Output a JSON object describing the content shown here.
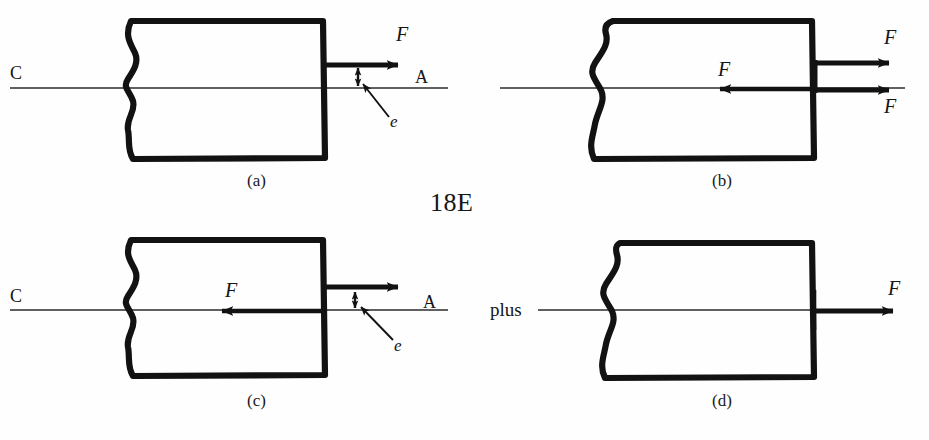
{
  "figure": {
    "center_label": "18E",
    "background_color": "#fefefe",
    "ink_color": "#111111",
    "panel_count": 4
  },
  "panels": [
    {
      "id": "a",
      "caption": "(a)",
      "left_axis_label": "C",
      "right_axis_label": "A",
      "eccentricity_label": "e",
      "forces": [
        {
          "label": "F",
          "direction": "right",
          "position": "above-axis"
        }
      ]
    },
    {
      "id": "b",
      "caption": "(b)",
      "left_axis_label": "",
      "right_axis_label": "",
      "eccentricity_label": "",
      "forces": [
        {
          "label": "F",
          "direction": "right",
          "position": "above-axis"
        },
        {
          "label": "F",
          "direction": "right",
          "position": "on-axis"
        },
        {
          "label": "F",
          "direction": "left",
          "position": "on-axis"
        }
      ]
    },
    {
      "id": "c",
      "caption": "(c)",
      "left_axis_label": "C",
      "right_axis_label": "A",
      "eccentricity_label": "e",
      "forces": [
        {
          "label": "F",
          "direction": "right",
          "position": "above-axis"
        },
        {
          "label": "F",
          "direction": "left",
          "position": "on-axis"
        }
      ]
    },
    {
      "id": "d",
      "caption": "(d)",
      "left_axis_label": "plus",
      "right_axis_label": "",
      "eccentricity_label": "",
      "forces": [
        {
          "label": "F",
          "direction": "right",
          "position": "on-axis"
        }
      ]
    }
  ]
}
